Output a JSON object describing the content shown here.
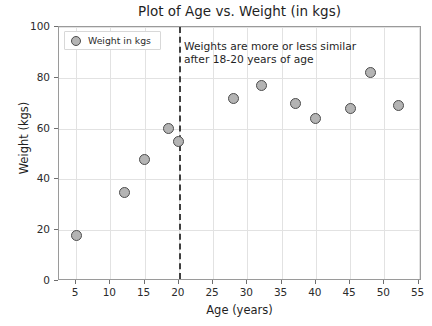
{
  "chart_data": {
    "type": "scatter",
    "title": "Plot of Age vs. Weight (in kgs)",
    "xlabel": "Age (years)",
    "ylabel": "Weight (kgs)",
    "xlim": [
      2.5,
      55.5
    ],
    "ylim": [
      0,
      100
    ],
    "xticks": [
      5,
      10,
      15,
      20,
      25,
      30,
      35,
      40,
      45,
      50,
      55
    ],
    "yticks": [
      0,
      20,
      40,
      60,
      80,
      100
    ],
    "grid": true,
    "legend": {
      "position": "upper left",
      "entries": [
        {
          "label": "Weight in kgs",
          "marker": "circle",
          "color": "#b4b4b4",
          "edge_color": "#4d4d4d"
        }
      ]
    },
    "series": [
      {
        "name": "Weight in kgs",
        "x": [
          5,
          12,
          15,
          18.5,
          20,
          28,
          32,
          37,
          40,
          45,
          48,
          52
        ],
        "y": [
          18,
          35,
          48,
          60,
          55,
          72,
          77,
          70,
          64,
          68,
          82,
          69
        ]
      }
    ],
    "annotations": [
      {
        "name": "similarity-note",
        "lines": [
          "Weights are more or less similar",
          "after 18-20 years of age"
        ],
        "x": 21.5,
        "y": 93
      },
      {
        "name": "threshold-line",
        "type": "vline",
        "x": 20,
        "style": "dashed",
        "color": "#3f3f3f"
      }
    ]
  }
}
